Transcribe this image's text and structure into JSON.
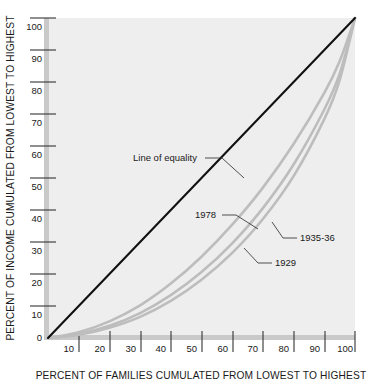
{
  "chart_data": {
    "type": "line",
    "title": "",
    "subtitle": "",
    "xlabel": "PERCENT OF FAMILIES CUMULATED FROM LOWEST TO HIGHEST",
    "ylabel": "PERCENT OF INCOME CUMULATED FROM LOWEST TO HIGHEST",
    "xlim": [
      0,
      100
    ],
    "ylim": [
      0,
      100
    ],
    "grid": false,
    "legend_position": "inline-annotations",
    "xticks": [
      10,
      20,
      30,
      40,
      50,
      60,
      70,
      80,
      90,
      100
    ],
    "xtick_labels": [
      "10",
      "20",
      "30",
      "40",
      "50",
      "60",
      "70",
      "80",
      "90",
      "100"
    ],
    "yticks": [
      0,
      10,
      20,
      30,
      40,
      50,
      60,
      70,
      80,
      90,
      100
    ],
    "ytick_labels": [
      "0",
      "10",
      "20",
      "30",
      "40",
      "50",
      "60",
      "70",
      "80",
      "90",
      "100"
    ],
    "x": [
      0,
      10,
      20,
      30,
      40,
      50,
      60,
      70,
      80,
      90,
      95,
      100
    ],
    "series": [
      {
        "name": "Line of equality",
        "label": "Line of equality",
        "color": "#111111",
        "kind": "reference",
        "values": [
          0,
          10,
          20,
          30,
          40,
          50,
          60,
          70,
          80,
          90,
          95,
          100
        ]
      },
      {
        "name": "1978",
        "label": "1978",
        "color": "#bdbdbd",
        "kind": "lorenz",
        "values": [
          0,
          1.8,
          5.2,
          10.2,
          17.0,
          25.4,
          35.4,
          47.0,
          60.6,
          76.6,
          86.5,
          100
        ]
      },
      {
        "name": "1935-36",
        "label": "1935-36",
        "color": "#bdbdbd",
        "kind": "lorenz",
        "values": [
          0,
          1.2,
          3.8,
          7.8,
          13.4,
          20.6,
          29.6,
          40.6,
          54.2,
          71.4,
          82.6,
          100
        ]
      },
      {
        "name": "1929",
        "label": "1929",
        "color": "#bdbdbd",
        "kind": "lorenz",
        "values": [
          0,
          1.0,
          3.2,
          6.6,
          11.6,
          18.2,
          26.6,
          37.2,
          50.6,
          68.4,
          80.6,
          100
        ]
      }
    ],
    "annotations": [
      {
        "text": "Line of equality",
        "anchor_x": 22,
        "anchor_y": 62
      },
      {
        "text": "1978",
        "anchor_x": 48,
        "anchor_y": 39
      },
      {
        "text": "1935-36",
        "anchor_x": 72,
        "anchor_y": 32
      },
      {
        "text": "1929",
        "anchor_x": 62,
        "anchor_y": 23
      }
    ]
  },
  "colors": {
    "plot_background": "#eeeeee",
    "equality_line": "#111111",
    "lorenz_curve": "#bdbdbd",
    "axis_bar": "#c9c9c9",
    "text": "#1a1a1a"
  }
}
